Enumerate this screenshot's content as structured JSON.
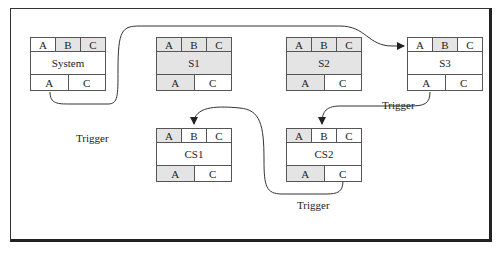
{
  "diagram": {
    "nodes": [
      {
        "id": "system",
        "name": "System",
        "x": 30,
        "y": 37,
        "top": [
          {
            "label": "A",
            "shaded": false
          },
          {
            "label": "B",
            "shaded": true
          },
          {
            "label": "C",
            "shaded": true
          }
        ],
        "mid_shaded": false,
        "bottom": [
          {
            "label": "A",
            "shaded": false
          },
          {
            "label": "C",
            "shaded": false
          }
        ]
      },
      {
        "id": "s1",
        "name": "S1",
        "x": 156,
        "y": 37,
        "top": [
          {
            "label": "A",
            "shaded": true
          },
          {
            "label": "B",
            "shaded": true
          },
          {
            "label": "C",
            "shaded": true
          }
        ],
        "mid_shaded": true,
        "bottom": [
          {
            "label": "A",
            "shaded": true
          },
          {
            "label": "C",
            "shaded": false
          }
        ]
      },
      {
        "id": "s2",
        "name": "S2",
        "x": 286,
        "y": 37,
        "top": [
          {
            "label": "A",
            "shaded": true
          },
          {
            "label": "B",
            "shaded": true
          },
          {
            "label": "C",
            "shaded": true
          }
        ],
        "mid_shaded": true,
        "bottom": [
          {
            "label": "A",
            "shaded": true
          },
          {
            "label": "C",
            "shaded": false
          }
        ]
      },
      {
        "id": "s3",
        "name": "S3",
        "x": 407,
        "y": 37,
        "top": [
          {
            "label": "A",
            "shaded": false
          },
          {
            "label": "B",
            "shaded": true
          },
          {
            "label": "C",
            "shaded": false
          }
        ],
        "mid_shaded": false,
        "bottom": [
          {
            "label": "A",
            "shaded": false
          },
          {
            "label": "C",
            "shaded": false
          }
        ]
      },
      {
        "id": "cs1",
        "name": "CS1",
        "x": 156,
        "y": 128,
        "top": [
          {
            "label": "A",
            "shaded": true
          },
          {
            "label": "B",
            "shaded": false
          },
          {
            "label": "C",
            "shaded": false
          }
        ],
        "mid_shaded": false,
        "bottom": [
          {
            "label": "A",
            "shaded": true
          },
          {
            "label": "C",
            "shaded": false
          }
        ]
      },
      {
        "id": "cs2",
        "name": "CS2",
        "x": 286,
        "y": 128,
        "top": [
          {
            "label": "A",
            "shaded": true
          },
          {
            "label": "B",
            "shaded": false
          },
          {
            "label": "C",
            "shaded": false
          }
        ],
        "mid_shaded": false,
        "bottom": [
          {
            "label": "A",
            "shaded": true
          },
          {
            "label": "C",
            "shaded": false
          }
        ]
      }
    ],
    "edges": [
      {
        "from": "System.A",
        "to": "S3.A",
        "label": "Trigger",
        "label_x": 76,
        "label_y": 132
      },
      {
        "from": "S3.A",
        "to": "CS2.B",
        "label": "Trigger",
        "label_x": 382,
        "label_y": 99
      },
      {
        "from": "CS2.C",
        "to": "CS1.B",
        "label": "Trigger",
        "label_x": 297,
        "label_y": 199
      }
    ],
    "colors": {
      "line": "#333333",
      "shade": "#e4e4e4",
      "border": "#555555"
    }
  }
}
